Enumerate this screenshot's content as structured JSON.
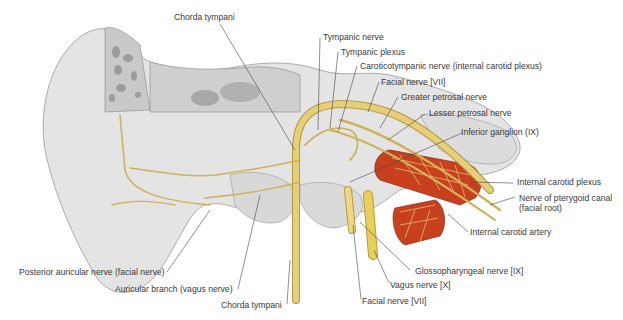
{
  "figure": {
    "colors": {
      "bone": "#e4e4e4",
      "bone_shade": "#b8b8b8",
      "nerve": "#e6cf7a",
      "nerve_dark": "#b89a3a",
      "artery": "#c8401e",
      "leader": "#444444",
      "text": "#3a3a3a"
    }
  },
  "labels": {
    "chorda_tympani_top": "Chorda tympani",
    "tympanic_nerve": "Tympanic nerve",
    "tympanic_plexus": "Tympanic plexus",
    "caroticotympanic_nerve": "Caroticotympanic nerve (internal carotid plexus)",
    "facial_nerve_top": "Facial nerve [VII]",
    "greater_petrosal_nerve": "Greater petrosal nerve",
    "lesser_petrosal_nerve": "Lesser petrosal nerve",
    "inferior_ganglion": "Inferior ganglion (IX)",
    "internal_carotid_plexus": "Internal carotid plexus",
    "nerve_pterygoid_canal_1": "Nerve of pterygoid canal",
    "nerve_pterygoid_canal_2": "(facial root)",
    "internal_carotid_artery": "Internal carotid artery",
    "glossopharyngeal_nerve": "Glossopharyngeal nerve [IX]",
    "vagus_nerve": "Vagus nerve [X]",
    "facial_nerve_bottom": "Facial nerve [VII]",
    "chorda_tympani_bottom": "Chorda tympani",
    "auricular_branch": "Auricular branch (vagus nerve)",
    "posterior_auricular_nerve": "Posterior auricular nerve (facial nerve)"
  }
}
